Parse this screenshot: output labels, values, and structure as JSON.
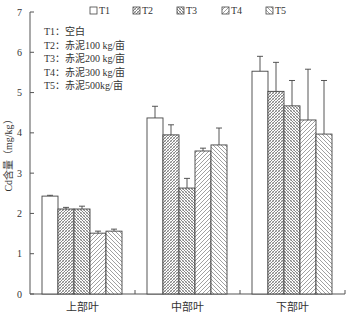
{
  "chart_data": {
    "type": "bar",
    "title": "",
    "xlabel": "",
    "ylabel": "Cd含量（mg/kg）",
    "ylim": [
      0,
      7
    ],
    "yticks": [
      0,
      1,
      2,
      3,
      4,
      5,
      6,
      7
    ],
    "grid": false,
    "legend_position": "top",
    "categories": [
      "上部叶",
      "中部叶",
      "下部叶"
    ],
    "series": [
      {
        "name": "T1",
        "pattern": "none",
        "values": [
          2.43,
          4.37,
          5.53
        ],
        "error": [
          0.02,
          0.29,
          0.37
        ]
      },
      {
        "name": "T2",
        "pattern": "dense-cross",
        "values": [
          2.11,
          3.95,
          5.03
        ],
        "error": [
          0.04,
          0.25,
          0.72
        ]
      },
      {
        "name": "T3",
        "pattern": "dense-cross2",
        "values": [
          2.11,
          2.63,
          4.67
        ],
        "error": [
          0.07,
          0.24,
          0.63
        ]
      },
      {
        "name": "T4",
        "pattern": "diag-right",
        "values": [
          1.51,
          3.55,
          4.32
        ],
        "error": [
          0.05,
          0.07,
          1.26
        ]
      },
      {
        "name": "T5",
        "pattern": "diag-left",
        "values": [
          1.56,
          3.7,
          3.97
        ],
        "error": [
          0.05,
          0.42,
          1.33
        ]
      }
    ],
    "annotations": [
      "T1：空白",
      "T2：赤泥100 kg/亩",
      "T3：赤泥200 kg/亩",
      "T4：赤泥300 kg/亩",
      "T5：赤泥500kg/亩"
    ]
  },
  "colors": {
    "axis": "#555555",
    "bar_stroke": "#444444",
    "hatch": "#666666",
    "fill": "#ffffff",
    "text": "#333333"
  }
}
